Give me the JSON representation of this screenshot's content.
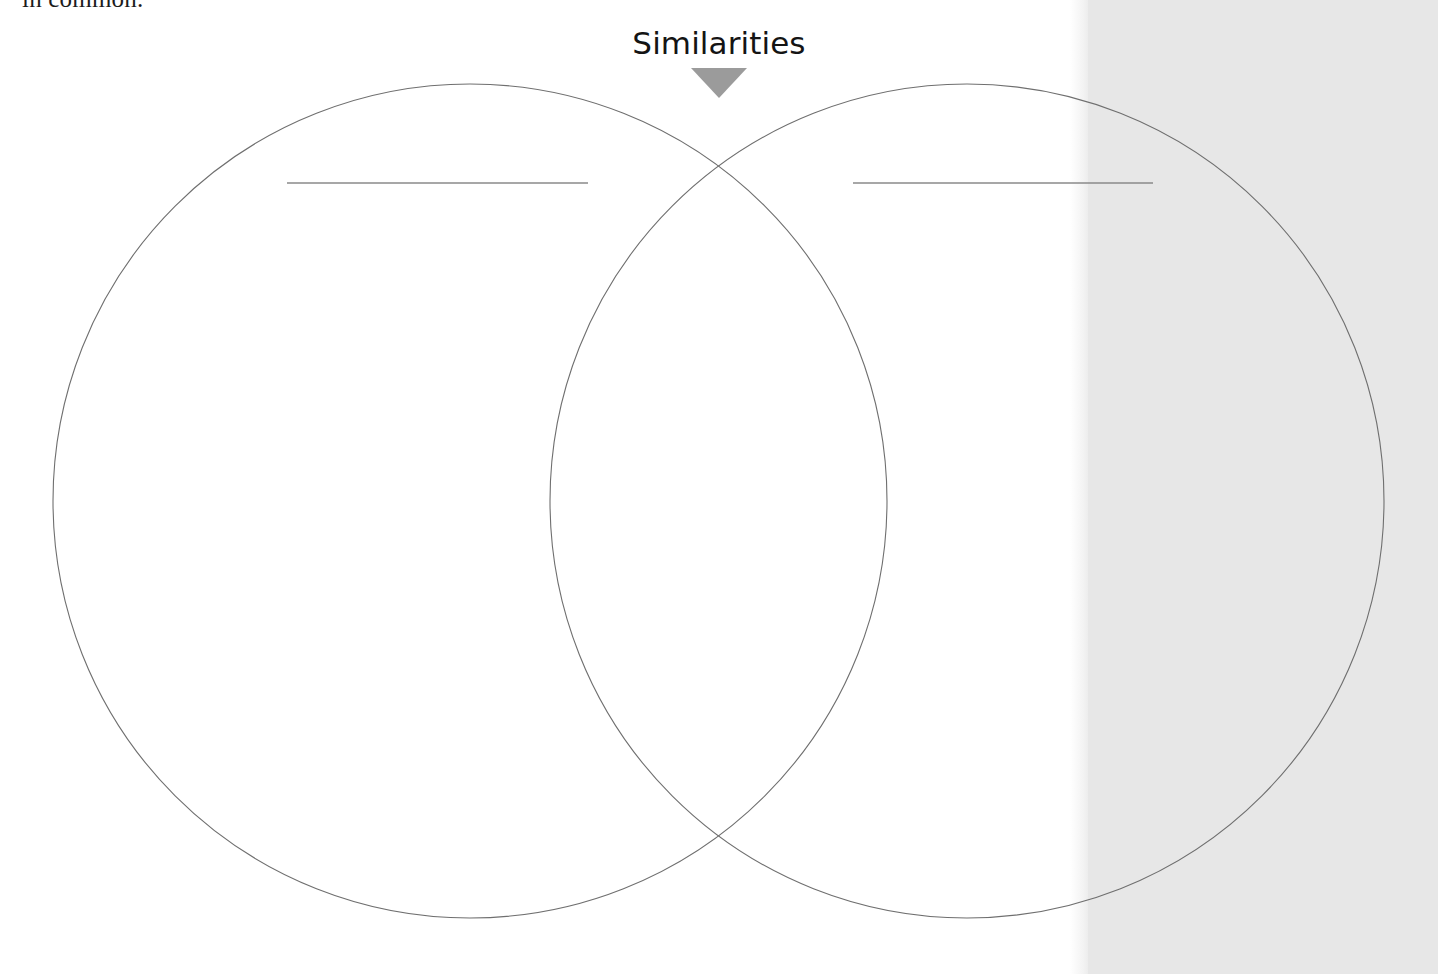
{
  "page": {
    "background_color": "#ffffff",
    "width": 974,
    "side_band_color": "#e7e7e7"
  },
  "body_text": {
    "clipped_line": "in common."
  },
  "heading": {
    "title": "Similarities",
    "arrow_icon": "triangle-down-icon",
    "arrow_color": "#9b9b9b"
  },
  "venn": {
    "stroke_color": "#6f6f6f",
    "stroke_width": 1,
    "fill": "none",
    "left_circle": {
      "label": "left-circle",
      "cx": 470,
      "cy": 501,
      "r": 417
    },
    "right_circle": {
      "label": "right-circle",
      "cx": 967,
      "cy": 501,
      "r": 417
    },
    "intersection_top": {
      "x": 718,
      "y": 148
    },
    "intersection_bottom": {
      "x": 718,
      "y": 853
    }
  },
  "write_lines": {
    "color": "#8a8a8a",
    "items": [
      {
        "name": "left-title-blank-line",
        "x1": 287,
        "x2": 588,
        "y": 183
      },
      {
        "name": "right-title-blank-line",
        "x1": 853,
        "x2": 1153,
        "y": 183
      }
    ]
  }
}
